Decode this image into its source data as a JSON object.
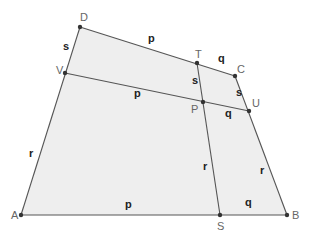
{
  "figure": {
    "type": "quadrilateral-subdivision",
    "fill_color": "#eeeeee",
    "line_color": "#555555",
    "vertices": {
      "A": {
        "label": "A",
        "x": 21,
        "y": 215,
        "lx": 11,
        "ly": 219
      },
      "B": {
        "label": "B",
        "x": 287,
        "y": 215,
        "lx": 292,
        "ly": 219
      },
      "C": {
        "label": "C",
        "x": 235,
        "y": 76,
        "lx": 237,
        "ly": 73
      },
      "D": {
        "label": "D",
        "x": 80,
        "y": 27,
        "lx": 80,
        "ly": 21
      },
      "T": {
        "label": "T",
        "x": 197,
        "y": 63,
        "lx": 195,
        "ly": 58
      },
      "U": {
        "label": "U",
        "x": 249,
        "y": 111,
        "lx": 252,
        "ly": 107
      },
      "V": {
        "label": "V",
        "x": 65,
        "y": 73,
        "lx": 56,
        "ly": 74
      },
      "P": {
        "label": "P",
        "x": 203,
        "y": 102,
        "lx": 191,
        "ly": 113
      },
      "S": {
        "label": "S",
        "x": 220,
        "y": 215,
        "lx": 217,
        "ly": 230
      }
    },
    "segment_labels": [
      {
        "text": "s",
        "x": 63,
        "y": 50,
        "note": "DV"
      },
      {
        "text": "p",
        "x": 148,
        "y": 42,
        "note": "DT"
      },
      {
        "text": "q",
        "x": 218,
        "y": 62,
        "note": "TC"
      },
      {
        "text": "s",
        "x": 192,
        "y": 84,
        "note": "TP"
      },
      {
        "text": "s",
        "x": 236,
        "y": 96,
        "note": "CU"
      },
      {
        "text": "p",
        "x": 134,
        "y": 97,
        "note": "VP"
      },
      {
        "text": "q",
        "x": 225,
        "y": 117,
        "note": "PU"
      },
      {
        "text": "r",
        "x": 29,
        "y": 157,
        "note": "VA"
      },
      {
        "text": "r",
        "x": 203,
        "y": 170,
        "note": "PS"
      },
      {
        "text": "r",
        "x": 260,
        "y": 174,
        "note": "UB"
      },
      {
        "text": "p",
        "x": 125,
        "y": 208,
        "note": "AS"
      },
      {
        "text": "q",
        "x": 245,
        "y": 206,
        "note": "SB"
      }
    ]
  }
}
